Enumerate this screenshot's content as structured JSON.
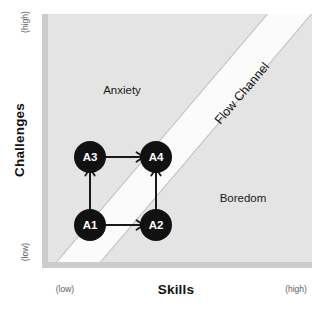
{
  "diagram": {
    "title": "Flow Channel",
    "axes": {
      "y": {
        "label": "Challenges",
        "high_label": "(high)",
        "low_label": "(low)"
      },
      "x": {
        "label": "Skills",
        "high_label": "(high)",
        "low_label": "(low)"
      }
    },
    "zones": {
      "anxiety": "Anxiety",
      "boredom": "Boredom",
      "channel": "Flow Channel"
    },
    "nodes": [
      {
        "id": "A1",
        "label": "A1",
        "cx": 90,
        "cy": 225
      },
      {
        "id": "A2",
        "label": "A2",
        "cx": 156,
        "cy": 225
      },
      {
        "id": "A3",
        "label": "A3",
        "cx": 90,
        "cy": 157
      },
      {
        "id": "A4",
        "label": "A4",
        "cx": 156,
        "cy": 157
      }
    ],
    "transitions": [
      {
        "from": "A1",
        "to": "A3",
        "direction": "up"
      },
      {
        "from": "A1",
        "to": "A2",
        "direction": "right"
      },
      {
        "from": "A3",
        "to": "A4",
        "direction": "right"
      },
      {
        "from": "A2",
        "to": "A4",
        "direction": "up"
      }
    ],
    "colors": {
      "background": "#ffffff",
      "plot_fill": "#e4e4e4",
      "channel_fill": "#fbfbfb",
      "channel_edge": "#c2c2c2",
      "axis_bar": "#cccccc",
      "node_fill": "#111111",
      "node_text": "#ffffff",
      "arrow": "#1a1a1a",
      "text": "#111111",
      "muted_text": "#5d5d5d"
    }
  }
}
